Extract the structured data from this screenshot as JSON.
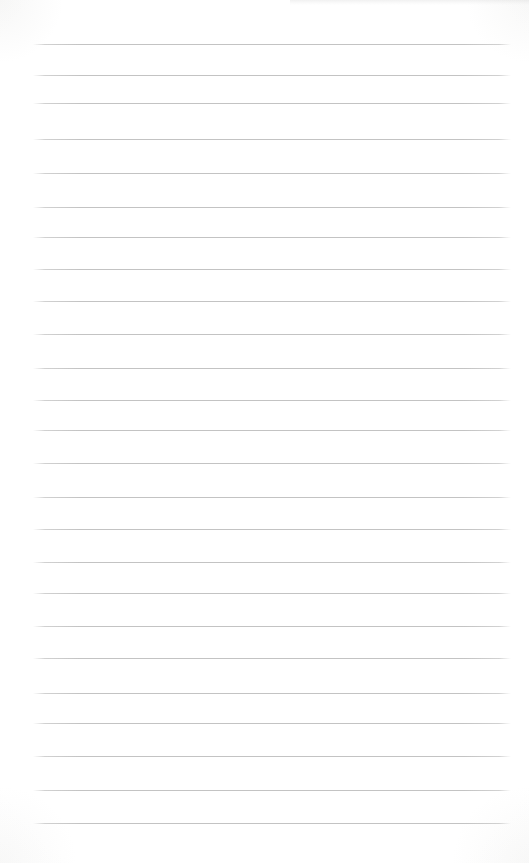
{
  "page": {
    "background_color": "#fdfdfc",
    "edge_tint_color": "#f2f2f0",
    "ruling": {
      "line_count": 25,
      "line_color": "#c5c5c5",
      "line_left": 33,
      "line_width": 478,
      "line_positions_y": [
        44,
        75,
        103,
        139,
        173,
        207,
        237,
        269,
        301,
        334,
        368,
        400,
        430,
        463,
        497,
        529,
        562,
        593,
        626,
        658,
        693,
        723,
        756,
        790,
        823
      ]
    }
  }
}
